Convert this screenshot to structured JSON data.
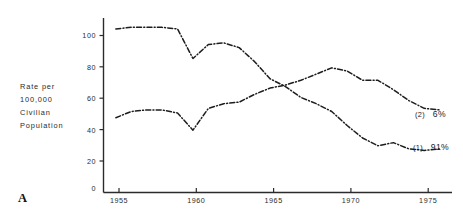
{
  "figure": {
    "panel_letter": "A",
    "axis_color": "#2b2b2b",
    "line_color": "#1d1d1d",
    "background": "#ffffff"
  },
  "axis_label": {
    "line1": "Rate per",
    "line2": "100,000",
    "line3": "Civilian",
    "line4": "Population"
  },
  "chart_data": {
    "type": "line",
    "title": "",
    "subtitle": "",
    "xlabel": "",
    "ylabel": "Rate per 100,000 Civilian Population",
    "xlim": [
      1954.2,
      1976.8
    ],
    "ylim": [
      0,
      112
    ],
    "grid": false,
    "legend_position": "right-inline",
    "xticks": [
      1955,
      1960,
      1965,
      1970,
      1975
    ],
    "xtick_labels": [
      "1955",
      "1960",
      "1965",
      "1970",
      "1975"
    ],
    "yticks": [
      0,
      20,
      40,
      60,
      80,
      100
    ],
    "ytick_labels": [
      "0",
      "20",
      "40",
      "60",
      "80",
      "100"
    ],
    "x": [
      1955,
      1956,
      1957,
      1958,
      1959,
      1960,
      1961,
      1962,
      1963,
      1964,
      1965,
      1966,
      1967,
      1968,
      1969,
      1970,
      1971,
      1972,
      1973,
      1974,
      1975,
      1976
    ],
    "series": [
      {
        "name": "(1) 91%",
        "label": "(1)",
        "percent": "91%",
        "description": "declining curve",
        "values": [
          105,
          106,
          106,
          106,
          105,
          86,
          95,
          96,
          93,
          84,
          73,
          68,
          61,
          57,
          52,
          43,
          35,
          30,
          32,
          28,
          27,
          28
        ],
        "end_label_x": 1976.1,
        "end_label_y": 28
      },
      {
        "name": "(2) 6%",
        "label": "(2)",
        "percent": "6%",
        "description": "rising then declining curve",
        "values": [
          48,
          52,
          53,
          53,
          51,
          40,
          54,
          57,
          58,
          63,
          67,
          69,
          72,
          76,
          80,
          78,
          72,
          72,
          66,
          59,
          54,
          53
        ],
        "end_label_x": 1975.6,
        "end_label_y": 53
      }
    ]
  }
}
